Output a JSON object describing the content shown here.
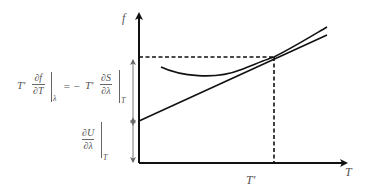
{
  "diagram": {
    "axes": {
      "y_label": "f",
      "x_label": "T",
      "x_marker_label": "T′"
    },
    "equation_top": {
      "lhs_coeff": "T′",
      "lhs_num": "∂f",
      "lhs_den": "∂T",
      "lhs_sub": "λ",
      "equals": "= −",
      "rhs_coeff": "T′",
      "rhs_num": "∂S",
      "rhs_den": "∂λ",
      "rhs_sub": "T"
    },
    "equation_bottom": {
      "num": "∂U",
      "den": "∂λ",
      "sub": "T"
    },
    "elements": {
      "curve": "convex curve f(T) tangent to line at T′",
      "tangent_line": "straight tangent line from intercept dU/dλ",
      "dashed_guides": "horizontal and vertical dashed lines at tangent point"
    },
    "colors": {
      "axis": "#111111",
      "curve": "#111111",
      "annotation": "#777777",
      "text": "#555555"
    }
  }
}
